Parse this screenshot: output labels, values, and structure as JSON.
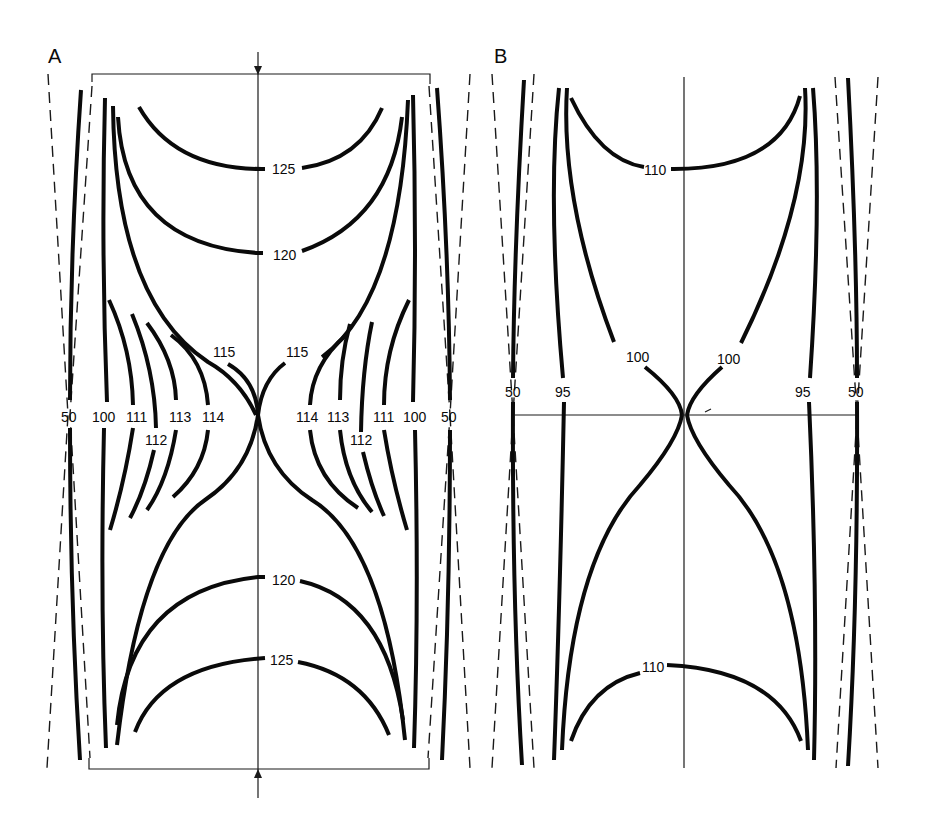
{
  "figure": {
    "panels": [
      {
        "id": "A",
        "label": "A",
        "contour_labels": {
          "top_125": "125",
          "top_120": "120",
          "left_115": "115",
          "right_115": "115",
          "left_50": "50",
          "left_100": "100",
          "left_111": "111",
          "left_112": "112",
          "left_113": "113",
          "left_114": "114",
          "right_114": "114",
          "right_113": "113",
          "right_112": "112",
          "right_111": "111",
          "right_100": "100",
          "right_50": "50",
          "bottom_120": "120",
          "bottom_125": "125"
        }
      },
      {
        "id": "B",
        "label": "B",
        "contour_labels": {
          "top_110": "110",
          "left_100": "100",
          "right_100": "100",
          "left_50": "50",
          "left_95": "95",
          "right_95": "95",
          "right_50": "50",
          "bottom_110": "110"
        }
      }
    ],
    "colors": {
      "line": "#0a0a0a",
      "background": "#ffffff"
    }
  }
}
